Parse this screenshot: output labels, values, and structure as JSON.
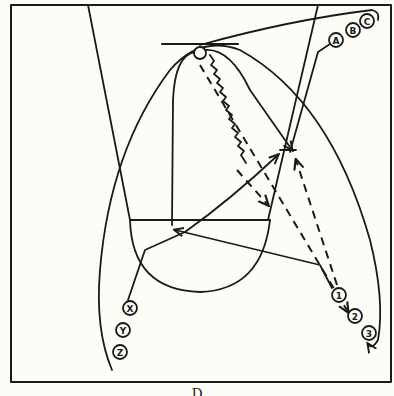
{
  "diagram": {
    "colors": {
      "background": "#fdfdf8",
      "ink": "#1a1a1a"
    },
    "caption": "D",
    "court": {
      "frame": {
        "x": 11,
        "y": 5,
        "w": 380,
        "h": 378
      },
      "lane_lines": "Free-throw lane lines converging from baseline to free-throw line",
      "free_throw_circle": "Semicircle below free-throw line"
    },
    "players": {
      "offense_top": [
        {
          "label": "A",
          "x": 336,
          "y": 40
        },
        {
          "label": "B",
          "x": 353,
          "y": 30
        },
        {
          "label": "C",
          "x": 367,
          "y": 21
        }
      ],
      "offense_left": [
        {
          "label": "X",
          "x": 130,
          "y": 308
        },
        {
          "label": "Y",
          "x": 123,
          "y": 330
        },
        {
          "label": "Z",
          "x": 120,
          "y": 352
        }
      ],
      "offense_right": [
        {
          "label": "1",
          "x": 339,
          "y": 295
        },
        {
          "label": "2",
          "x": 355,
          "y": 316
        },
        {
          "label": "3",
          "x": 369,
          "y": 333
        }
      ]
    },
    "legend": {
      "solid_line": "cut / player movement",
      "dashed_line": "pass",
      "wavy_line": "dribble",
      "open_circle": "basket / ball"
    }
  }
}
